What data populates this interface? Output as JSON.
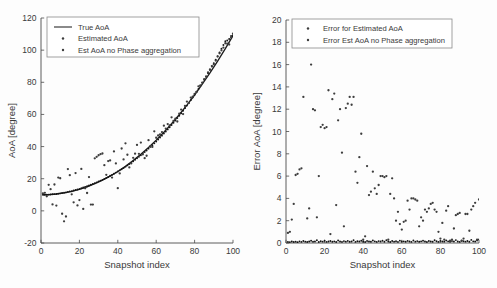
{
  "figure": {
    "background": "#fdfdfd",
    "series_color": "#3d3d3d",
    "curve_color": "#1d1d1d"
  },
  "chart_data": [
    {
      "id": "left",
      "type": "scatter",
      "title": "",
      "xlabel": "Snapshot index",
      "ylabel": "AoA [degree]",
      "xlim": [
        0,
        100
      ],
      "ylim": [
        -20,
        120
      ],
      "xticks": [
        0,
        20,
        40,
        60,
        80,
        100
      ],
      "yticks": [
        -20,
        0,
        20,
        40,
        60,
        80,
        100,
        120
      ],
      "grid": false,
      "legend_position": "top-left",
      "legend": [
        {
          "label": "True AoA",
          "marker": "line"
        },
        {
          "label": "Estimated AoA",
          "marker": "dot"
        },
        {
          "label": "Est AoA no Phase aggregation",
          "marker": "dot"
        }
      ],
      "series": [
        {
          "name": "True AoA",
          "marker": "line",
          "x": [
            1,
            4,
            8,
            12,
            16,
            20,
            24,
            28,
            32,
            36,
            40,
            44,
            48,
            52,
            56,
            60,
            64,
            68,
            72,
            76,
            80,
            84,
            88,
            92,
            96,
            100
          ],
          "values": [
            10.0,
            10.1,
            10.5,
            11.2,
            12.1,
            13.4,
            15.0,
            16.9,
            19.1,
            21.6,
            24.5,
            27.7,
            31.3,
            35.2,
            39.4,
            44.0,
            48.9,
            54.2,
            59.8,
            65.8,
            72.1,
            78.8,
            85.8,
            93.2,
            100.9,
            109.0
          ]
        },
        {
          "name": "Estimated AoA",
          "marker": "dot",
          "x": [
            1,
            2,
            3,
            4,
            5,
            6,
            7,
            8,
            9,
            10,
            11,
            12,
            13,
            14,
            15,
            16,
            17,
            18,
            19,
            20,
            21,
            22,
            23,
            24,
            25,
            26,
            27,
            28,
            29,
            30,
            31,
            32,
            33,
            34,
            35,
            36,
            37,
            38,
            39,
            40,
            41,
            42,
            43,
            44,
            45,
            46,
            47,
            48,
            49,
            50,
            51,
            52,
            53,
            54,
            55,
            56,
            57,
            58,
            59,
            60,
            61,
            62,
            63,
            64,
            65,
            66,
            67,
            68,
            69,
            70,
            71,
            72,
            73,
            74,
            75,
            76,
            77,
            78,
            79,
            80,
            81,
            82,
            83,
            84,
            85,
            86,
            87,
            88,
            89,
            90,
            91,
            92,
            93,
            94,
            95,
            96,
            97,
            98,
            99,
            100
          ],
          "values": [
            10.0,
            10.0,
            10.1,
            10.1,
            10.2,
            10.3,
            10.4,
            10.5,
            10.7,
            10.9,
            11.1,
            11.3,
            11.5,
            11.8,
            12.1,
            12.2,
            12.7,
            13.0,
            13.3,
            13.6,
            14.1,
            14.5,
            14.9,
            15.3,
            15.8,
            16.2,
            16.7,
            17.2,
            17.7,
            18.3,
            18.8,
            19.3,
            19.9,
            20.5,
            21.1,
            21.8,
            22.4,
            23.1,
            23.8,
            24.5,
            25.2,
            25.9,
            26.7,
            27.5,
            28.3,
            29.1,
            30.0,
            30.9,
            31.8,
            32.7,
            33.6,
            34.6,
            35.6,
            36.6,
            37.6,
            38.7,
            39.8,
            40.9,
            42.0,
            43.2,
            44.4,
            45.6,
            46.8,
            48.1,
            49.4,
            50.7,
            52.0,
            53.4,
            54.8,
            56.2,
            57.7,
            59.2,
            60.7,
            62.3,
            63.9,
            65.5,
            67.2,
            68.9,
            70.6,
            72.3,
            74.1,
            75.9,
            77.8,
            79.7,
            81.6,
            83.6,
            85.6,
            87.7,
            89.8,
            91.9,
            94.1,
            96.3,
            98.6,
            100.9,
            103.2,
            105.6,
            106.0,
            106.9,
            108.8,
            109.1
          ]
        },
        {
          "name": "Est AoA no Phase aggregation",
          "marker": "dot",
          "x": [
            1,
            2,
            3,
            4,
            5,
            6,
            7,
            8,
            9,
            10,
            11,
            12,
            13,
            14,
            15,
            16,
            17,
            18,
            19,
            20,
            21,
            22,
            23,
            24,
            25,
            26,
            27,
            28,
            29,
            30,
            31,
            32,
            33,
            34,
            35,
            36,
            37,
            38,
            39,
            40,
            41,
            42,
            43,
            44,
            45,
            46,
            47,
            48,
            49,
            50,
            51,
            52,
            53,
            54,
            55,
            56,
            57,
            58,
            59,
            60,
            61,
            62,
            63,
            64,
            65,
            66,
            67,
            68,
            69,
            70,
            71,
            72,
            73,
            74,
            75,
            76,
            77,
            78,
            79,
            80,
            81,
            82,
            83,
            84,
            85,
            86,
            87,
            88,
            89,
            90,
            91,
            92,
            93,
            94,
            95,
            96,
            97,
            98,
            99,
            100
          ],
          "values": [
            10.9,
            11.2,
            9.1,
            16.2,
            13.5,
            4.0,
            16.4,
            3.3,
            20.7,
            20.3,
            -1.8,
            -6.5,
            -3.5,
            26.0,
            22.2,
            10.3,
            5.3,
            23.5,
            3.4,
            6.7,
            26.1,
            1.2,
            14.0,
            11.1,
            21.0,
            3.9,
            3.9,
            32.7,
            33.6,
            34.6,
            35.3,
            35.7,
            28.4,
            22.4,
            31.0,
            31.4,
            20.7,
            37.0,
            29.5,
            14.1,
            23.3,
            38.8,
            32.0,
            42.0,
            34.9,
            27.0,
            29.5,
            33.0,
            35.6,
            41.0,
            35.5,
            42.5,
            35.1,
            32.8,
            34.3,
            44.0,
            40.3,
            39.8,
            49.5,
            45.5,
            46.9,
            47.5,
            49.0,
            53.0,
            51.2,
            54.0,
            53.1,
            58.2,
            56.0,
            57.3,
            55.6,
            60.5,
            63.0,
            60.2,
            65.3,
            68.0,
            67.1,
            70.5,
            71.0,
            72.8,
            74.0,
            77.5,
            78.0,
            79.8,
            82.0,
            83.5,
            86.1,
            88.0,
            90.1,
            91.2,
            93.5,
            96.0,
            98.0,
            99.9,
            101.6,
            104.3,
            104.0,
            103.5,
            108.0,
            110.2
          ]
        }
      ]
    },
    {
      "id": "right",
      "type": "scatter",
      "title": "",
      "xlabel": "Snapshot index",
      "ylabel": "Error AoA [degree]",
      "xlim": [
        0,
        100
      ],
      "ylim": [
        0,
        20
      ],
      "xticks": [
        0,
        20,
        40,
        60,
        80,
        100
      ],
      "yticks": [
        0,
        2,
        4,
        6,
        8,
        10,
        12,
        14,
        16,
        18,
        20
      ],
      "grid": false,
      "legend_position": "top-left",
      "legend": [
        {
          "label": "Error for Estimated AoA",
          "marker": "dot"
        },
        {
          "label": "Error Est AoA no Phase aggregation",
          "marker": "dot"
        }
      ],
      "series": [
        {
          "name": "Error for Estimated AoA",
          "marker": "dot",
          "x": [
            1,
            2,
            3,
            4,
            5,
            6,
            7,
            8,
            9,
            10,
            11,
            12,
            13,
            14,
            15,
            16,
            17,
            18,
            19,
            20,
            21,
            22,
            23,
            24,
            25,
            26,
            27,
            28,
            29,
            30,
            31,
            32,
            33,
            34,
            35,
            36,
            37,
            38,
            39,
            40,
            41,
            42,
            43,
            44,
            45,
            46,
            47,
            48,
            49,
            50,
            51,
            52,
            53,
            54,
            55,
            56,
            57,
            58,
            59,
            60,
            61,
            62,
            63,
            64,
            65,
            66,
            67,
            68,
            69,
            70,
            71,
            72,
            73,
            74,
            75,
            76,
            77,
            78,
            79,
            80,
            81,
            82,
            83,
            84,
            85,
            86,
            87,
            88,
            89,
            90,
            91,
            92,
            93,
            94,
            95,
            96,
            97,
            98,
            99,
            100
          ],
          "values": [
            0.1,
            0.08,
            0.14,
            0.09,
            0.12,
            0.07,
            0.15,
            0.1,
            0.18,
            0.12,
            0.09,
            0.14,
            0.2,
            0.11,
            0.13,
            0.25,
            0.09,
            0.16,
            0.12,
            0.2,
            0.1,
            0.14,
            0.18,
            0.11,
            0.15,
            0.09,
            0.22,
            0.13,
            0.1,
            0.17,
            0.12,
            0.19,
            0.11,
            0.14,
            0.25,
            0.1,
            0.16,
            0.13,
            0.2,
            0.12,
            0.09,
            0.18,
            0.14,
            0.11,
            0.22,
            0.15,
            0.1,
            0.17,
            0.13,
            0.2,
            0.11,
            0.24,
            0.14,
            0.09,
            0.18,
            0.12,
            0.16,
            0.1,
            0.21,
            0.13,
            0.15,
            0.11,
            0.19,
            0.14,
            0.1,
            0.23,
            0.12,
            0.17,
            0.11,
            0.15,
            0.2,
            0.13,
            0.09,
            0.18,
            0.14,
            0.11,
            0.25,
            0.16,
            0.1,
            0.19,
            0.13,
            0.12,
            0.22,
            0.15,
            0.11,
            0.17,
            0.13,
            0.26,
            0.14,
            0.1,
            0.2,
            0.16,
            0.12,
            0.18,
            0.11,
            0.28,
            0.15,
            0.13,
            0.22,
            0.31
          ]
        },
        {
          "name": "Error Est AoA no Phase aggregation",
          "marker": "dot",
          "x": [
            1,
            2,
            3,
            4,
            5,
            6,
            7,
            8,
            9,
            10,
            11,
            12,
            13,
            14,
            15,
            16,
            17,
            18,
            19,
            20,
            21,
            22,
            23,
            24,
            25,
            26,
            27,
            28,
            29,
            30,
            31,
            32,
            33,
            34,
            35,
            36,
            37,
            38,
            39,
            40,
            41,
            42,
            43,
            44,
            45,
            46,
            47,
            48,
            49,
            50,
            51,
            52,
            53,
            54,
            55,
            56,
            57,
            58,
            59,
            60,
            61,
            62,
            63,
            64,
            65,
            66,
            67,
            68,
            69,
            70,
            71,
            72,
            73,
            74,
            75,
            76,
            77,
            78,
            79,
            80,
            81,
            82,
            83,
            84,
            85,
            86,
            87,
            88,
            89,
            90,
            91,
            92,
            93,
            94,
            95,
            96,
            97,
            98,
            99,
            100
          ],
          "values": [
            0.9,
            1.0,
            2.1,
            3.5,
            6.1,
            6.2,
            6.6,
            6.7,
            13.1,
            18.3,
            2.2,
            3.1,
            16.0,
            12.0,
            11.9,
            2.3,
            6.0,
            10.4,
            10.6,
            10.3,
            10.4,
            13.7,
            0.8,
            12.9,
            13.4,
            3.4,
            11.0,
            12.0,
            8.1,
            1.5,
            12.1,
            12.5,
            13.1,
            12.4,
            13.1,
            6.4,
            5.4,
            7.7,
            9.8,
            0.3,
            0.6,
            6.9,
            4.3,
            4.6,
            6.4,
            4.9,
            4.4,
            5.2,
            6.0,
            6.0,
            5.9,
            6.0,
            0.3,
            4.4,
            5.8,
            4.0,
            2.0,
            2.8,
            1.7,
            1.2,
            1.9,
            2.0,
            3.8,
            3.0,
            4.0,
            4.0,
            3.9,
            3.8,
            1.5,
            2.3,
            2.0,
            3.0,
            2.8,
            3.1,
            3.5,
            3.6,
            3.0,
            2.8,
            1.0,
            0.4,
            1.8,
            0.3,
            2.9,
            3.3,
            0.2,
            0.3,
            1.3,
            2.5,
            2.6,
            2.7,
            0.2,
            0.4,
            2.6,
            2.6,
            1.1,
            3.0,
            3.3,
            3.6,
            0.3,
            3.9
          ]
        }
      ]
    }
  ]
}
